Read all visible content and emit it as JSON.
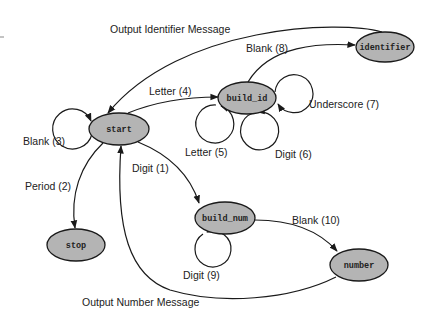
{
  "diagram": {
    "type": "state-transition-diagram",
    "colors": {
      "node_fill": "#b4b4b4",
      "stroke": "#1a1a1a",
      "background": "#ffffff"
    },
    "nodes": [
      {
        "id": "start",
        "label": "start",
        "cx": 119,
        "cy": 129,
        "rx": 30,
        "ry": 16
      },
      {
        "id": "build_id",
        "label": "build_id",
        "cx": 247,
        "cy": 98,
        "rx": 29,
        "ry": 16
      },
      {
        "id": "identifier",
        "label": "identifier",
        "cx": 385,
        "cy": 47,
        "rx": 29,
        "ry": 15
      },
      {
        "id": "stop",
        "label": "stop",
        "cx": 76,
        "cy": 245,
        "rx": 29,
        "ry": 16
      },
      {
        "id": "build_num",
        "label": "build_num",
        "cx": 225,
        "cy": 218,
        "rx": 30,
        "ry": 16
      },
      {
        "id": "number",
        "label": "number",
        "cx": 359,
        "cy": 265,
        "rx": 29,
        "ry": 16
      }
    ],
    "edges": [
      {
        "id": "output-identifier",
        "from": "identifier",
        "to": "start",
        "label": "Output Identifier Message"
      },
      {
        "id": "blank-8",
        "from": "build_id",
        "to": "identifier",
        "label": "Blank (8)"
      },
      {
        "id": "letter-4",
        "from": "start",
        "to": "build_id",
        "label": "Letter (4)"
      },
      {
        "id": "blank-3",
        "from": "start",
        "to": "start",
        "label": "Blank (3)"
      },
      {
        "id": "underscore-7",
        "from": "build_id",
        "to": "build_id",
        "label": "Underscore (7)"
      },
      {
        "id": "letter-5",
        "from": "build_id",
        "to": "build_id",
        "label": "Letter (5)"
      },
      {
        "id": "digit-6",
        "from": "build_id",
        "to": "build_id",
        "label": "Digit (6)"
      },
      {
        "id": "period-2",
        "from": "start",
        "to": "stop",
        "label": "Period (2)"
      },
      {
        "id": "digit-1",
        "from": "start",
        "to": "build_num",
        "label": "Digit (1)"
      },
      {
        "id": "blank-10",
        "from": "build_num",
        "to": "number",
        "label": "Blank (10)"
      },
      {
        "id": "digit-9",
        "from": "build_num",
        "to": "build_num",
        "label": "Digit (9)"
      },
      {
        "id": "output-number",
        "from": "number",
        "to": "start",
        "label": "Output Number Message"
      }
    ]
  },
  "labels": {
    "output_identifier": "Output Identifier Message",
    "blank_8": "Blank (8)",
    "letter_4": "Letter (4)",
    "blank_3": "Blank (3)",
    "underscore_7": "Underscore (7)",
    "letter_5": "Letter (5)",
    "digit_6": "Digit (6)",
    "period_2": "Period (2)",
    "digit_1": "Digit (1)",
    "blank_10": "Blank (10)",
    "digit_9": "Digit (9)",
    "output_number": "Output Number Message"
  },
  "node_labels": {
    "start": "start",
    "build_id": "build_id",
    "identifier": "identifier",
    "stop": "stop",
    "build_num": "build_num",
    "number": "number"
  }
}
